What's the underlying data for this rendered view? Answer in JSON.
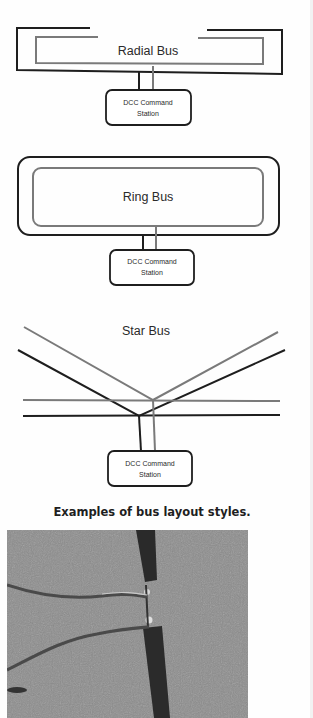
{
  "diagrams": {
    "radial": {
      "title": "Radial Bus",
      "station_line1": "DCC Command",
      "station_line2": "Station"
    },
    "ring": {
      "title": "Ring Bus",
      "station_line1": "DCC Command",
      "station_line2": "Station"
    },
    "star": {
      "title": "Star Bus",
      "station_line1": "DCC Command",
      "station_line2": "Station"
    }
  },
  "caption": "Examples of bus layout styles.",
  "photo": {
    "description": "Close-up photo of two feeder wires soldered to a dark rail/bus on a gray speckled surface"
  },
  "colors": {
    "black_wire": "#1e1e1e",
    "gray_wire": "#7a7a7a",
    "background": "#fefefe"
  }
}
